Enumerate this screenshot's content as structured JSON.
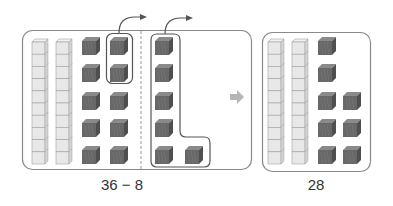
{
  "problem": {
    "expression": "36 − 8",
    "tens_rods": 2,
    "ones_cubes": 6,
    "borrowed_rod_broken_into": 10,
    "cubes_removed_from_original": 2,
    "cubes_removed_from_broken_rod": 6
  },
  "result": {
    "value": "28",
    "tens_rods": 2,
    "ones_cubes": 8
  },
  "transition_icon": "right-arrow-icon",
  "colors": {
    "rod_fill": "#e6e6e6",
    "rod_stroke": "#9a9a9a",
    "cube_fill": "#6b6b6b",
    "cube_top": "#8a8a8a",
    "frame_stroke": "#8a8a8a",
    "arrow": "#555555",
    "transition_arrow": "#b5b5b5"
  }
}
